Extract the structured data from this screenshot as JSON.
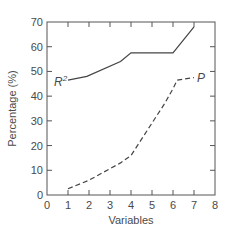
{
  "chart_data": {
    "type": "line",
    "title": "",
    "xlabel": "Variables",
    "ylabel": "Percentage (%)",
    "xlim": [
      0,
      8
    ],
    "ylim": [
      0,
      70
    ],
    "xticks": [
      0,
      1,
      2,
      3,
      4,
      5,
      6,
      7,
      8
    ],
    "yticks": [
      0,
      10,
      20,
      30,
      40,
      50,
      60,
      70
    ],
    "grid": false,
    "legend": "inline labels",
    "series": [
      {
        "name": "R²",
        "label_main": "R",
        "label_sup": "2",
        "style": "solid",
        "x": [
          1,
          1.9,
          3.5,
          4,
          6,
          7
        ],
        "y": [
          46.5,
          48,
          54,
          57.5,
          57.5,
          68
        ]
      },
      {
        "name": "P",
        "label_main": "P",
        "style": "dashed",
        "x": [
          1,
          2,
          3.5,
          4,
          5.6,
          6,
          6.2,
          7
        ],
        "y": [
          2.5,
          6,
          13,
          16,
          37,
          43,
          46.5,
          47.5
        ]
      }
    ]
  },
  "colors": {
    "axis": "#555555",
    "line": "#444444",
    "text": "#4a4a4a"
  }
}
